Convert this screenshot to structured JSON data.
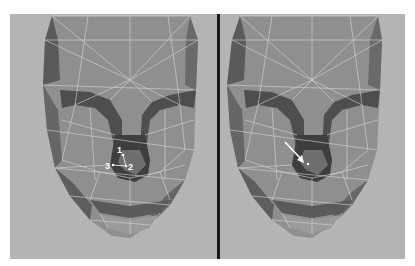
{
  "figure": {
    "panels": [
      {
        "id": "left",
        "vertex_labels": [
          {
            "text": "1",
            "x": 112,
            "y": 151
          },
          {
            "text": "2",
            "x": 127,
            "y": 167
          },
          {
            "text": "3",
            "x": 105,
            "y": 167
          }
        ]
      },
      {
        "id": "right",
        "annotation": "arrow pointing to nostril vertex"
      }
    ],
    "colors": {
      "background": "#b4b4b4",
      "mesh_light": "#8f8f8f",
      "mesh_dark": "#5a5a5a",
      "wire": "#d8d8d8",
      "divider": "#1a1a1a"
    }
  }
}
